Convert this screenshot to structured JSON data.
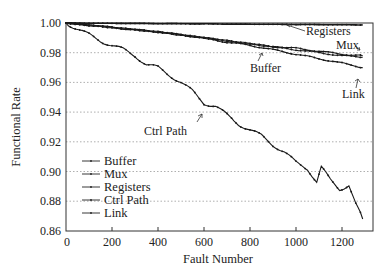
{
  "chart_data": {
    "type": "line",
    "title": "",
    "xlabel": "Fault Number",
    "ylabel": "Functional Rate",
    "xlim": [
      0,
      1330
    ],
    "ylim": [
      0.86,
      1.0
    ],
    "xticks": [
      0,
      200,
      400,
      600,
      800,
      1000,
      1200
    ],
    "yticks": [
      0.86,
      0.88,
      0.9,
      0.92,
      0.94,
      0.96,
      0.98,
      1.0
    ],
    "ytick_labels": [
      "0.86",
      "0.88",
      "0.90",
      "0.92",
      "0.94",
      "0.96",
      "0.98",
      "1.00"
    ],
    "grid": "horizontal dotted",
    "legend_position": "lower left",
    "legend": [
      "Buffer",
      "Mux",
      "Registers",
      "Ctrl Path",
      "Link"
    ],
    "series": [
      {
        "name": "Buffer",
        "x": [
          0,
          100,
          200,
          300,
          400,
          500,
          600,
          700,
          800,
          900,
          1000,
          1100,
          1200,
          1290
        ],
        "values": [
          1.0,
          0.9985,
          0.997,
          0.9955,
          0.994,
          0.992,
          0.99,
          0.988,
          0.986,
          0.984,
          0.982,
          0.98,
          0.978,
          0.977
        ]
      },
      {
        "name": "Mux",
        "x": [
          0,
          100,
          200,
          300,
          400,
          500,
          600,
          700,
          800,
          900,
          1000,
          1100,
          1200,
          1290
        ],
        "values": [
          1.0,
          0.9985,
          0.997,
          0.9955,
          0.994,
          0.992,
          0.99,
          0.988,
          0.986,
          0.984,
          0.983,
          0.981,
          0.979,
          0.978
        ]
      },
      {
        "name": "Registers",
        "x": [
          0,
          200,
          400,
          600,
          800,
          1000,
          1200,
          1290
        ],
        "values": [
          1.0,
          0.9998,
          0.9996,
          0.9994,
          0.9992,
          0.999,
          0.9988,
          0.9987
        ]
      },
      {
        "name": "Ctrl Path",
        "x": [
          0,
          50,
          100,
          150,
          200,
          250,
          300,
          350,
          400,
          450,
          500,
          550,
          600,
          650,
          700,
          750,
          800,
          850,
          900,
          950,
          1000,
          1050,
          1090,
          1110,
          1150,
          1190,
          1230,
          1260,
          1290
        ],
        "values": [
          1.0,
          0.996,
          0.992,
          0.988,
          0.985,
          0.982,
          0.978,
          0.972,
          0.97,
          0.965,
          0.96,
          0.954,
          0.946,
          0.944,
          0.938,
          0.932,
          0.928,
          0.924,
          0.918,
          0.913,
          0.906,
          0.902,
          0.893,
          0.903,
          0.894,
          0.888,
          0.891,
          0.878,
          0.868
        ]
      },
      {
        "name": "Link",
        "x": [
          0,
          100,
          200,
          300,
          400,
          500,
          600,
          700,
          800,
          900,
          1000,
          1100,
          1200,
          1290
        ],
        "values": [
          1.0,
          0.9985,
          0.997,
          0.9955,
          0.994,
          0.992,
          0.99,
          0.987,
          0.985,
          0.982,
          0.979,
          0.976,
          0.973,
          0.97
        ]
      }
    ],
    "annotations": [
      {
        "text": "Registers",
        "points_to": "Registers",
        "at_x": 850
      },
      {
        "text": "Mux",
        "points_to": "Mux",
        "at_x": 1270
      },
      {
        "text": "Buffer",
        "points_to": "Buffer",
        "at_x": 800
      },
      {
        "text": "Link",
        "points_to": "Link",
        "at_x": 1270
      },
      {
        "text": "Ctrl Path",
        "points_to": "Ctrl Path",
        "at_x": 690
      }
    ]
  },
  "labels": {
    "xlabel": "Fault Number",
    "ylabel": "Functional Rate",
    "x_ticks": [
      "0",
      "200",
      "400",
      "600",
      "800",
      "1000",
      "1200"
    ],
    "y_ticks": [
      "1.00",
      "0.98",
      "0.96",
      "0.94",
      "0.92",
      "0.90",
      "0.88",
      "0.86"
    ],
    "legend": [
      "Buffer",
      "Mux",
      "Registers",
      "Ctrl Path",
      "Link"
    ],
    "annotations": {
      "registers": "Registers",
      "mux": "Mux",
      "buffer": "Buffer",
      "link": "Link",
      "ctrl_path": "Ctrl Path"
    }
  }
}
